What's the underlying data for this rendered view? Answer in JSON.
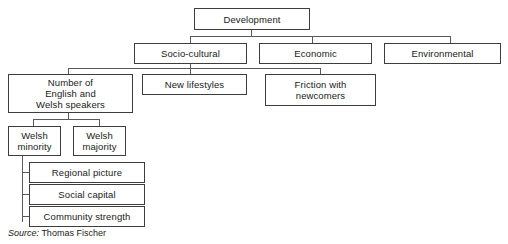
{
  "diagram": {
    "type": "hierarchy-tree",
    "nodes": [
      {
        "id": "development",
        "label": "Development",
        "level": 0
      },
      {
        "id": "socio-cultural",
        "label": "Socio-cultural",
        "level": 1
      },
      {
        "id": "economic",
        "label": "Economic",
        "level": 1
      },
      {
        "id": "environmental",
        "label": "Environmental",
        "level": 1
      },
      {
        "id": "number-of-speakers",
        "label": "Number of\nEnglish and\nWelsh speakers",
        "level": 2
      },
      {
        "id": "new-lifestyles",
        "label": "New lifestyles",
        "level": 2
      },
      {
        "id": "friction-newcomers",
        "label": "Friction with\nnewcomers",
        "level": 2
      },
      {
        "id": "welsh-minority",
        "label": "Welsh\nminority",
        "level": 3
      },
      {
        "id": "welsh-majority",
        "label": "Welsh\nmajority",
        "level": 3
      },
      {
        "id": "regional-picture",
        "label": "Regional picture",
        "level": 4
      },
      {
        "id": "social-capital",
        "label": "Social capital",
        "level": 4
      },
      {
        "id": "community-strength",
        "label": "Community strength",
        "level": 4
      }
    ],
    "edges": [
      {
        "from": "development",
        "to": "socio-cultural"
      },
      {
        "from": "development",
        "to": "economic"
      },
      {
        "from": "development",
        "to": "environmental"
      },
      {
        "from": "socio-cultural",
        "to": "number-of-speakers"
      },
      {
        "from": "socio-cultural",
        "to": "new-lifestyles"
      },
      {
        "from": "socio-cultural",
        "to": "friction-newcomers"
      },
      {
        "from": "number-of-speakers",
        "to": "welsh-minority"
      },
      {
        "from": "number-of-speakers",
        "to": "welsh-majority"
      },
      {
        "from": "welsh-minority",
        "to": "regional-picture"
      },
      {
        "from": "welsh-minority",
        "to": "social-capital"
      },
      {
        "from": "welsh-minority",
        "to": "community-strength"
      }
    ],
    "labels": {
      "development": "Development",
      "socio_cultural": "Socio-cultural",
      "economic": "Economic",
      "environmental": "Environmental",
      "number_of_speakers_line1": "Number of",
      "number_of_speakers_line2": "English and",
      "number_of_speakers_line3": "Welsh speakers",
      "new_lifestyles": "New lifestyles",
      "friction_line1": "Friction with",
      "friction_line2": "newcomers",
      "welsh_minority_line1": "Welsh",
      "welsh_minority_line2": "minority",
      "welsh_majority_line1": "Welsh",
      "welsh_majority_line2": "majority",
      "regional_picture": "Regional picture",
      "social_capital": "Social capital",
      "community_strength": "Community strength"
    }
  },
  "source": {
    "label": "Source:",
    "value": "Thomas Fischer"
  },
  "colors": {
    "background": "#ffffff",
    "box_border": "#3d3d3d",
    "connector": "#5a5a5a",
    "text": "#1a1a1a"
  }
}
